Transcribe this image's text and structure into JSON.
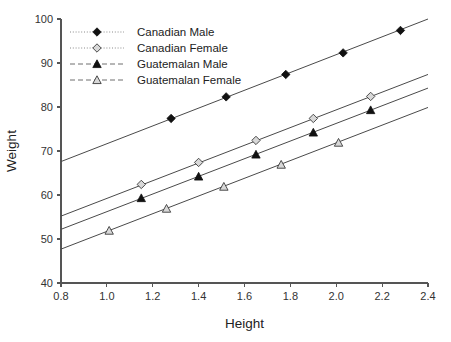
{
  "chart_data": {
    "type": "scatter",
    "title": "",
    "xlabel": "Height",
    "ylabel": "Weight",
    "xlim": [
      0.8,
      2.4
    ],
    "ylim": [
      40,
      100
    ],
    "xticks": [
      "0.8",
      "1.0",
      "1.2",
      "1.4",
      "1.6",
      "1.8",
      "2.0",
      "2.2",
      "2.4"
    ],
    "yticks": [
      "40",
      "50",
      "60",
      "70",
      "80",
      "90",
      "100"
    ],
    "grid": false,
    "legend_position": "top-left",
    "series": [
      {
        "name": "Canadian Male",
        "marker": "filled-diamond",
        "line_style": "solid",
        "legend_style": "dotted",
        "color": "#111111",
        "points": [
          {
            "x": 1.28,
            "y": 77.4
          },
          {
            "x": 1.52,
            "y": 82.3
          },
          {
            "x": 1.78,
            "y": 87.4
          },
          {
            "x": 2.03,
            "y": 92.3
          },
          {
            "x": 2.28,
            "y": 97.4
          }
        ],
        "fit_line": {
          "x0": 0.8,
          "y0": 67.6,
          "x1": 2.4,
          "y1": 100.0
        }
      },
      {
        "name": "Canadian Female",
        "marker": "open-diamond",
        "line_style": "solid",
        "legend_style": "dotted",
        "color": "#d8d8d8",
        "points": [
          {
            "x": 1.15,
            "y": 62.4
          },
          {
            "x": 1.4,
            "y": 67.4
          },
          {
            "x": 1.65,
            "y": 72.4
          },
          {
            "x": 1.9,
            "y": 77.4
          },
          {
            "x": 2.15,
            "y": 82.4
          }
        ],
        "fit_line": {
          "x0": 0.8,
          "y0": 55.2,
          "x1": 2.4,
          "y1": 87.4
        }
      },
      {
        "name": "Guatemalan Male",
        "marker": "filled-triangle",
        "line_style": "solid",
        "legend_style": "dashed",
        "color": "#111111",
        "points": [
          {
            "x": 1.15,
            "y": 59.3
          },
          {
            "x": 1.4,
            "y": 64.2
          },
          {
            "x": 1.65,
            "y": 69.2
          },
          {
            "x": 1.9,
            "y": 74.2
          },
          {
            "x": 2.15,
            "y": 79.3
          }
        ],
        "fit_line": {
          "x0": 0.8,
          "y0": 52.2,
          "x1": 2.4,
          "y1": 84.3
        }
      },
      {
        "name": "Guatemalan Female",
        "marker": "open-triangle",
        "line_style": "solid",
        "legend_style": "dashed",
        "color": "#d8d8d8",
        "points": [
          {
            "x": 1.01,
            "y": 51.9
          },
          {
            "x": 1.26,
            "y": 56.9
          },
          {
            "x": 1.51,
            "y": 61.9
          },
          {
            "x": 1.76,
            "y": 66.9
          },
          {
            "x": 2.01,
            "y": 71.9
          }
        ],
        "fit_line": {
          "x0": 0.8,
          "y0": 47.7,
          "x1": 2.4,
          "y1": 79.9
        }
      }
    ]
  }
}
